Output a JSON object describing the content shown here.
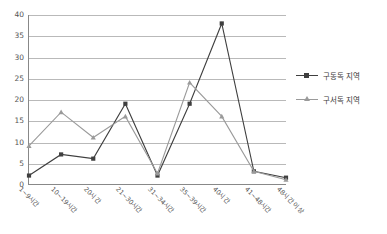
{
  "chart_data": {
    "type": "line",
    "title": "",
    "xlabel": "",
    "ylabel": "",
    "ylim": [
      0,
      40
    ],
    "ytick_step": 5,
    "yticks": [
      "0",
      "5",
      "10",
      "15",
      "20",
      "25",
      "30",
      "35",
      "40"
    ],
    "grid": true,
    "legend_position": "right",
    "categories": [
      "1~9시간",
      "10~19시간",
      "20시간",
      "21~30시간",
      "31~34시간",
      "35~39시간",
      "40시간",
      "41~48시간",
      "48시간 이상"
    ],
    "series": [
      {
        "name": "구동독 지역",
        "color": "#3f3f3f",
        "marker": "square",
        "values": [
          2,
          7,
          6,
          19,
          2,
          19,
          38,
          3,
          1.5
        ]
      },
      {
        "name": "구서독 지역",
        "color": "#9a9a9a",
        "marker": "triangle",
        "values": [
          9,
          17,
          11,
          16,
          2.5,
          24,
          16,
          3,
          1
        ]
      }
    ]
  },
  "legend": {
    "items": [
      {
        "label": "구동독 지역"
      },
      {
        "label": "구서독 지역"
      }
    ]
  },
  "colors": {
    "series_east": "#3f3f3f",
    "series_west": "#9a9a9a",
    "gridline": "#b9b9b9",
    "axis": "#888888",
    "text": "#555555",
    "background": "#ffffff"
  }
}
